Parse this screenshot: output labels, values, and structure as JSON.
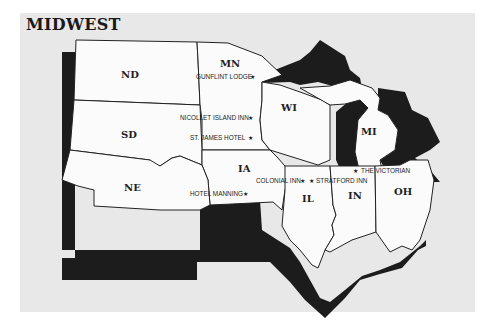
{
  "title": "MIDWEST",
  "colors": {
    "background": "#e8e8e8",
    "state_fill": "#fbfbfb",
    "shadow": "#1c1c1c",
    "border": "#222222"
  },
  "states": [
    {
      "abbr": "ND"
    },
    {
      "abbr": "MN"
    },
    {
      "abbr": "SD"
    },
    {
      "abbr": "WI"
    },
    {
      "abbr": "MI"
    },
    {
      "abbr": "IA"
    },
    {
      "abbr": "NE"
    },
    {
      "abbr": "IL"
    },
    {
      "abbr": "IN"
    },
    {
      "abbr": "OH"
    }
  ],
  "hotels": [
    {
      "name": "GUNFLINT LODGE",
      "state": "MN"
    },
    {
      "name": "NICOLLET ISLAND INN",
      "state": "MN"
    },
    {
      "name": "ST. JAMES HOTEL",
      "state": "MN"
    },
    {
      "name": "HOTEL MANNING",
      "state": "IA"
    },
    {
      "name": "COLONIAL INN",
      "state": "IL"
    },
    {
      "name": "STRATFORD INN",
      "state": "IN"
    },
    {
      "name": "THE VICTORIAN",
      "state": "MI"
    }
  ],
  "marker_glyph": "★"
}
